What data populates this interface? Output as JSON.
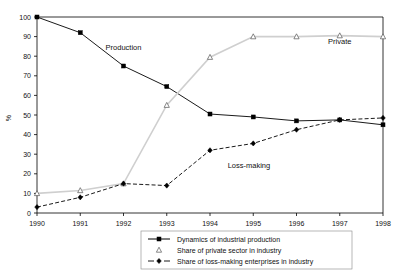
{
  "chart_data": {
    "type": "line",
    "title": "",
    "xlabel": "",
    "ylabel": "%",
    "categories": [
      "1990",
      "1991",
      "1992",
      "1993",
      "1994",
      "1995",
      "1996",
      "1997",
      "1998"
    ],
    "ylim": [
      0,
      100
    ],
    "yticks": [
      "0",
      "10",
      "20",
      "30",
      "40",
      "50",
      "60",
      "70",
      "80",
      "90",
      "100"
    ],
    "grid": false,
    "legend_position": "bottom",
    "series": [
      {
        "name": "Dynamics of industrial production",
        "marker": "filled-square",
        "line_style": "solid",
        "color": "#000000",
        "values": [
          100,
          92,
          75,
          64.5,
          50.5,
          49,
          47,
          47.5,
          45
        ]
      },
      {
        "name": "Share of private sector in industry",
        "marker": "open-triangle",
        "line_style": "solid",
        "color": "#cfcfcf",
        "values": [
          10,
          11.5,
          15,
          55,
          79.5,
          90,
          90,
          90.5,
          90
        ]
      },
      {
        "name": "Share of  loss-making enterprises in industry",
        "marker": "filled-diamond",
        "line_style": "dashed",
        "color": "#000000",
        "values": [
          3,
          8,
          15,
          14,
          32,
          35.5,
          42.5,
          47.5,
          48.5
        ]
      }
    ],
    "annotations": [
      {
        "text": "Production",
        "x_value": 1992,
        "y_value": 83
      },
      {
        "text": "Private",
        "x_value": 1997,
        "y_value": 86
      },
      {
        "text": "Loss-making",
        "x_value": 1994.9,
        "y_value": 23
      }
    ]
  }
}
